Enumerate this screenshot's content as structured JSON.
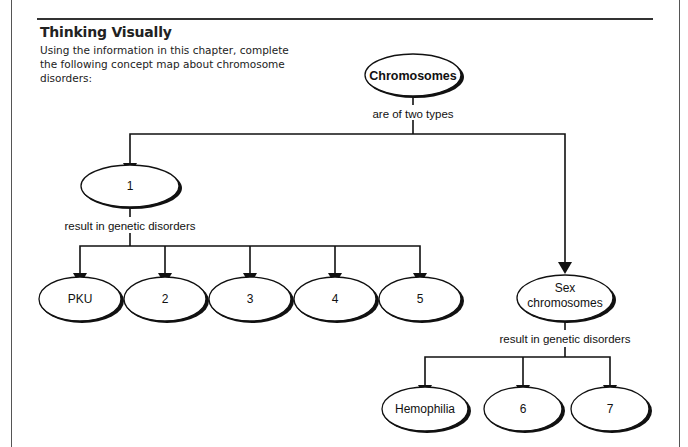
{
  "section": {
    "heading": "Thinking Visually",
    "instructions": "Using the information in this chapter, complete the following concept map about chromosome disorders:"
  },
  "concept_map": {
    "root": {
      "label": "Chromosomes"
    },
    "root_link": "are of two types",
    "branch_left": {
      "label": "1",
      "link": "result in genetic disorders",
      "children": [
        {
          "label": "PKU"
        },
        {
          "label": "2"
        },
        {
          "label": "3"
        },
        {
          "label": "4"
        },
        {
          "label": "5"
        }
      ]
    },
    "branch_right": {
      "label_line1": "Sex",
      "label_line2": "chromosomes",
      "link": "result in genetic disorders",
      "children": [
        {
          "label": "Hemophilia"
        },
        {
          "label": "6"
        },
        {
          "label": "7"
        }
      ]
    }
  }
}
